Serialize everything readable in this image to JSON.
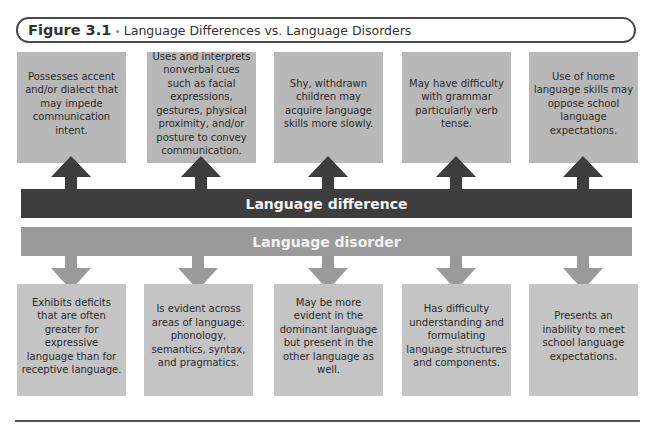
{
  "figure": {
    "label": "Figure 3.1",
    "separator": "•",
    "title": "Language Differences vs. Language Disorders"
  },
  "bars": {
    "difference": "Language difference",
    "disorder": "Language disorder"
  },
  "difference_items": [
    "Possesses accent and/or dialect that may impede communication intent.",
    "Uses and interprets nonverbal cues such as facial expressions, gestures, physical proximity, and/or posture to convey communication.",
    "Shy, withdrawn children may acquire language skills more slowly.",
    "May have difficulty with grammar particularly verb tense.",
    "Use of home language skills may oppose school language expectations."
  ],
  "disorder_items": [
    "Exhibits deficits that are often greater for expressive language than for receptive language.",
    "Is evident across areas of language: phonology, semantics, syntax, and pragmatics.",
    "May be more evident in the dominant language but present in the other language as well.",
    "Has difficulty understanding and formulating language structures and components.",
    "Presents an inability to meet school language expectations."
  ],
  "colors": {
    "difference_bar": "#3d3d3d",
    "disorder_bar": "#9a9a9a",
    "top_box": "#b8b8b8",
    "bottom_box": "#c4c4c4",
    "up_arrow": "#3d3d3d",
    "down_arrow": "#9a9a9a"
  }
}
